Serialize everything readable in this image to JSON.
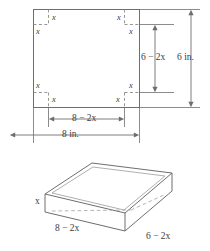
{
  "figure": {
    "colors": {
      "line": "#6e6e6e",
      "dashed": "#8a8a8a",
      "text": "#3b3b3b",
      "background": "#ffffff"
    },
    "flat_sheet": {
      "corner_cut_labels": [
        {
          "id": "tl-vertical",
          "text": "x"
        },
        {
          "id": "tl-horizontal",
          "text": "x"
        },
        {
          "id": "tr-vertical",
          "text": "x"
        },
        {
          "id": "tr-horizontal",
          "text": "x"
        },
        {
          "id": "bl-horizontal",
          "text": "x"
        },
        {
          "id": "bl-vertical",
          "text": "x"
        },
        {
          "id": "br-horizontal",
          "text": "x"
        },
        {
          "id": "br-vertical",
          "text": "x"
        }
      ],
      "dimensions": {
        "inner_height": "6 − 2x",
        "outer_height": "6 in.",
        "inner_width": "8 − 2x",
        "outer_width": "8 in."
      }
    },
    "box_3d": {
      "height_label": "x",
      "length_label": "8 − 2x",
      "width_label": "6 − 2x"
    }
  }
}
